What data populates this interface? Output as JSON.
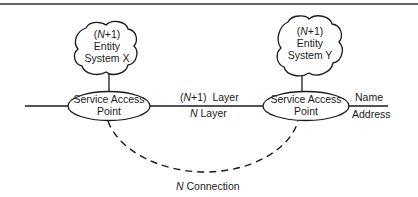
{
  "diagram": {
    "entities": [
      {
        "id": "entity-x",
        "lines": [
          "(N+1)",
          "Entity",
          "System X"
        ],
        "n_prefix": "N",
        "line1_rest": "+1)"
      },
      {
        "id": "entity-y",
        "lines": [
          "(N+1)",
          "Entity",
          "System Y"
        ],
        "n_prefix": "N",
        "line1_rest": "+1)"
      }
    ],
    "access_points": [
      {
        "id": "sap-left",
        "lines": [
          "Service Access",
          "Point"
        ]
      },
      {
        "id": "sap-right",
        "lines": [
          "Service Access",
          "Point"
        ]
      }
    ],
    "layer_labels": {
      "upper": {
        "open": "(",
        "n": "N",
        "rest": "+1)  Layer"
      },
      "lower": {
        "n": "N",
        "rest": " Layer"
      }
    },
    "name_label": "Name",
    "address_label": "Address",
    "connection_label": {
      "n": "N",
      "rest": " Connection"
    }
  },
  "colors": {
    "line": "#1a1a1a",
    "background": "#ffffff"
  }
}
